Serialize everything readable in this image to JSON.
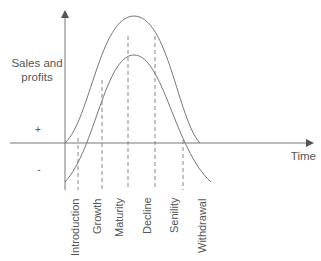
{
  "diagram": {
    "type": "product-life-cycle",
    "y_axis_label_line1": "Sales and",
    "y_axis_label_line2": "profits",
    "x_axis_label": "Time",
    "plus_sign": "+",
    "minus_sign": "-",
    "curves": [
      {
        "name": "Sales",
        "description": "outer bell curve, starts at origin"
      },
      {
        "name": "Profits",
        "description": "inner bell curve, starts below zero"
      }
    ],
    "stages": [
      {
        "label": "Introduction"
      },
      {
        "label": "Growth"
      },
      {
        "label": "Maturity"
      },
      {
        "label": "Decline"
      },
      {
        "label": "Senility"
      },
      {
        "label": "Withdrawal"
      }
    ],
    "colors": {
      "line": "#777777",
      "text": "#555555",
      "background": "#ffffff"
    }
  }
}
